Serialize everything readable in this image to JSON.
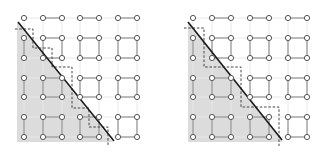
{
  "colors": {
    "background": "#ffffff",
    "shade": "#dcdcdc",
    "faint_grid": "#e8e8e8",
    "edge": "#8a8a8a",
    "node_stroke": "#555555",
    "node_fill": "#ffffff",
    "diagonal": "#1a1a1a",
    "staircase": "#444444"
  },
  "grid": {
    "rows": 7,
    "cols": 7,
    "row_y": [
      18,
      38,
      58,
      78,
      97,
      117,
      137
    ],
    "node_radius": 2.6
  },
  "panels": [
    {
      "name": "left-panel",
      "col_x": [
        24,
        43,
        62,
        80,
        99,
        118,
        137
      ],
      "shade_polygon": [
        [
          17,
          22
        ],
        [
          113,
          142
        ],
        [
          17,
          142
        ]
      ],
      "diagonal": [
        [
          18,
          22
        ],
        [
          114,
          141
        ]
      ],
      "staircase": [
        [
          15,
          29
        ],
        [
          33,
          29
        ],
        [
          33,
          48
        ],
        [
          52,
          48
        ],
        [
          52,
          67
        ],
        [
          72,
          67
        ],
        [
          72,
          108
        ],
        [
          89,
          108
        ],
        [
          89,
          127
        ],
        [
          108,
          127
        ],
        [
          108,
          146
        ]
      ]
    },
    {
      "name": "right-panel",
      "col_x": [
        193,
        212,
        231,
        250,
        269,
        288,
        307
      ],
      "shade_polygon": [
        [
          188,
          22
        ],
        [
          283,
          142
        ],
        [
          188,
          142
        ]
      ],
      "diagonal": [
        [
          188,
          22
        ],
        [
          282,
          140
        ]
      ],
      "staircase": [
        [
          184,
          28
        ],
        [
          204,
          28
        ],
        [
          204,
          67
        ],
        [
          241,
          67
        ],
        [
          241,
          107
        ],
        [
          279,
          107
        ],
        [
          279,
          146
        ]
      ]
    }
  ],
  "edges": {
    "row0_horizontal_pairs": [
      [
        1,
        2
      ],
      [
        3,
        4
      ],
      [
        5,
        6
      ]
    ],
    "row_pairs": [
      [
        1,
        2
      ],
      [
        3,
        4
      ],
      [
        5,
        6
      ]
    ],
    "col0_vertical": true,
    "square_col_pairs": [
      [
        1,
        2
      ],
      [
        3,
        4
      ],
      [
        5,
        6
      ]
    ]
  }
}
